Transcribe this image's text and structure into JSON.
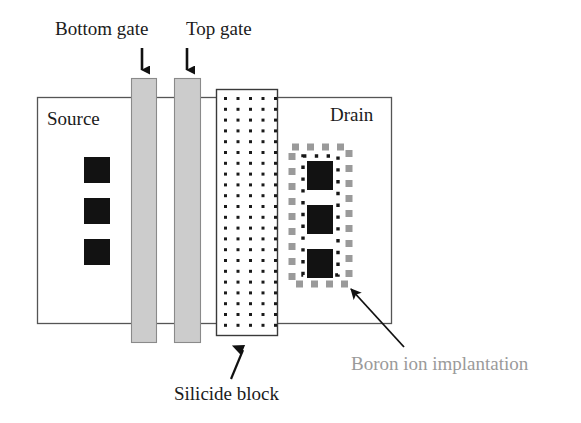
{
  "figure": {
    "type": "cross-section-device-schematic",
    "background_color": "#ffffff"
  },
  "labels": {
    "bottom_gate": "Bottom gate",
    "top_gate": "Top gate",
    "source": "Source",
    "drain": "Drain",
    "silicide_block": "Silicide block",
    "boron_implantation": "Boron ion implantation"
  },
  "colors": {
    "outline": "#555555",
    "gate_fill": "#cccccc",
    "gate_stroke": "#8a8a8a",
    "silicide_fill": "#ffffff",
    "silicide_stroke": "#3a3a3a",
    "dot_color": "#1a1a1a",
    "contact_black": "#121212",
    "implant_gray": "#9a9a9a",
    "arrow_black": "#111111",
    "boron_text": "#9a9a9a"
  },
  "regions": {
    "body": {
      "name": "device-body",
      "x": 37,
      "y": 97,
      "width": 355,
      "height": 227
    },
    "bottom_gate_bar": {
      "name": "bottom-gate-bar",
      "x": 131,
      "y": 78,
      "width": 25,
      "height": 265
    },
    "top_gate_bar": {
      "name": "top-gate-bar",
      "x": 174,
      "y": 78,
      "width": 26,
      "height": 265
    },
    "silicide_block": {
      "name": "silicide-block",
      "x": 216,
      "y": 89,
      "width": 61,
      "height": 246
    },
    "implant_box": {
      "name": "boron-implant-region",
      "x": 291,
      "y": 146,
      "width": 59,
      "height": 139
    }
  },
  "source_contacts": [
    {
      "x": 84,
      "y": 157,
      "width": 26,
      "height": 26
    },
    {
      "x": 84,
      "y": 198,
      "width": 26,
      "height": 26
    },
    {
      "x": 84,
      "y": 239,
      "width": 26,
      "height": 26
    }
  ],
  "drain_contacts": [
    {
      "x": 307,
      "y": 161,
      "width": 26,
      "height": 29
    },
    {
      "x": 307,
      "y": 205,
      "width": 26,
      "height": 29
    },
    {
      "x": 307,
      "y": 249,
      "width": 26,
      "height": 29
    }
  ],
  "silicide_dots": {
    "columns": 5,
    "rows": 22,
    "x_start": 224,
    "y_start": 97,
    "x_spacing": 12.5,
    "y_spacing": 10.8,
    "dot_size": 3
  },
  "arrows": {
    "bottom_gate": {
      "name": "bottom-gate-arrow",
      "x1": 142,
      "y1": 48,
      "x2": 142,
      "y2": 76,
      "direction": "down"
    },
    "top_gate": {
      "name": "top-gate-arrow",
      "x1": 187,
      "y1": 48,
      "x2": 187,
      "y2": 76,
      "direction": "down"
    },
    "silicide": {
      "name": "silicide-block-arrow",
      "x1": 230,
      "y1": 378,
      "x2": 244,
      "y2": 340,
      "direction": "up"
    },
    "boron": {
      "name": "boron-implantation-arrow",
      "x1": 404,
      "y1": 345,
      "x2": 348,
      "y2": 285,
      "direction": "up-left"
    }
  }
}
